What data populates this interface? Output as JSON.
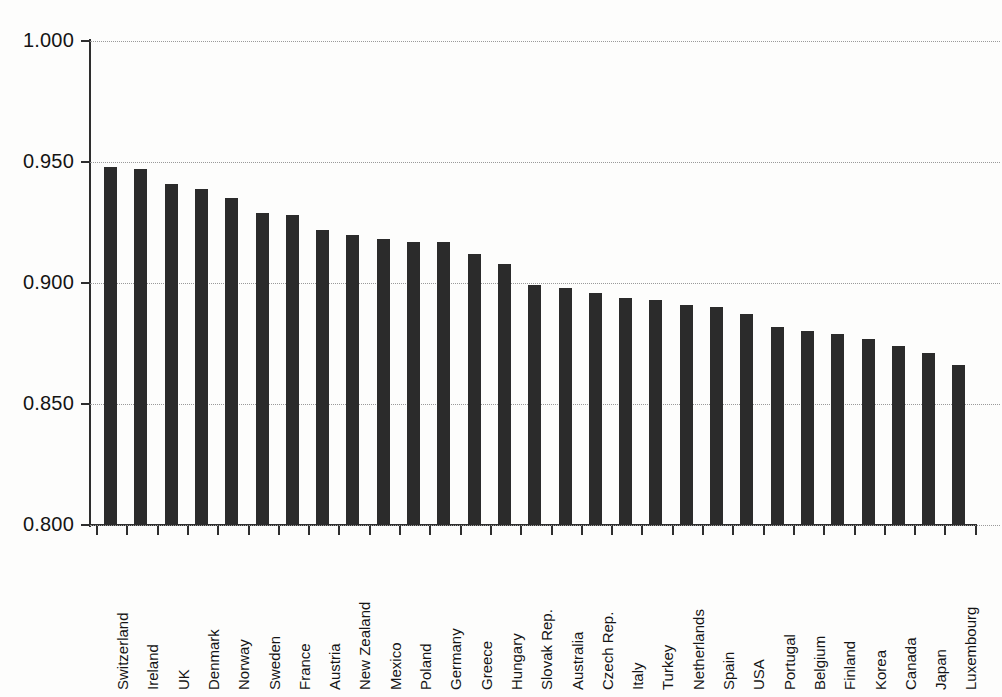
{
  "chart_data": {
    "type": "bar",
    "title": "",
    "subtitle": "",
    "xlabel": "",
    "ylabel": "",
    "ylim": [
      0.8,
      1.0
    ],
    "yticks": [
      1.0,
      0.95,
      0.9,
      0.85,
      0.8
    ],
    "ytick_labels": [
      "1.000",
      "0.950",
      "0.900",
      "0.850",
      "0.800"
    ],
    "grid": true,
    "grid_style": "dotted",
    "legend": "none",
    "orientation": "vertical",
    "bar_color": "#2b2b2b",
    "background_color": "#fdfdfc",
    "axis_color": "#2e2e2e",
    "categories": [
      "Switzerland",
      "Ireland",
      "UK",
      "Denmark",
      "Norway",
      "Sweden",
      "France",
      "Austria",
      "New Zealand",
      "Mexico",
      "Poland",
      "Germany",
      "Greece",
      "Hungary",
      "Slovak Rep.",
      "Australia",
      "Czech Rep.",
      "Italy",
      "Turkey",
      "Netherlands",
      "Spain",
      "USA",
      "Portugal",
      "Belgium",
      "Finland",
      "Korea",
      "Canada",
      "Japan",
      "Luxembourg"
    ],
    "values": [
      0.948,
      0.947,
      0.941,
      0.939,
      0.935,
      0.929,
      0.928,
      0.922,
      0.92,
      0.918,
      0.917,
      0.917,
      0.912,
      0.908,
      0.899,
      0.898,
      0.896,
      0.894,
      0.893,
      0.891,
      0.89,
      0.887,
      0.882,
      0.88,
      0.879,
      0.877,
      0.874,
      0.871,
      0.866
    ]
  }
}
